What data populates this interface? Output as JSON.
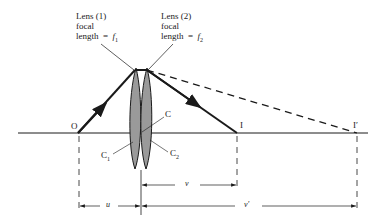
{
  "diagram": {
    "type": "thin lens combination ray diagram",
    "lens1": {
      "title": "Lens (1)",
      "line2": "focal",
      "line3": "length  =  ",
      "symbol": "f",
      "sub": "1"
    },
    "lens2": {
      "title": "Lens (2)",
      "line2": "focal",
      "line3": "length  =  ",
      "symbol": "f",
      "sub": "2"
    },
    "points": {
      "object": "O",
      "center": "C",
      "c1": {
        "symbol": "C",
        "sub": "1"
      },
      "c2": {
        "symbol": "C",
        "sub": "2"
      },
      "image": "I",
      "image_prime": "I′"
    },
    "dimensions": {
      "u": "u",
      "v": "v",
      "v_prime": "v′"
    },
    "colors": {
      "line": "#1a1a1a",
      "lens_fill": "#9a9a9a",
      "background": "#ffffff"
    }
  }
}
